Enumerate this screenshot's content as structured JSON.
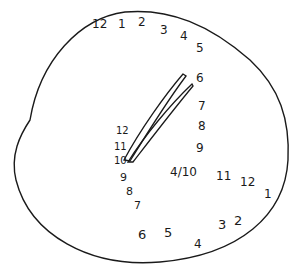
{
  "figure": {
    "type": "hand-drawn clock sketch",
    "stroke_color": "#1a1a1a",
    "background": "#ffffff",
    "numbers": [
      {
        "id": "n-top-12",
        "text": "12",
        "x": 92,
        "y": 18
      },
      {
        "id": "n-top-1",
        "text": "1",
        "x": 118,
        "y": 18
      },
      {
        "id": "n-top-2",
        "text": "2",
        "x": 138,
        "y": 16
      },
      {
        "id": "n-top-3",
        "text": "3",
        "x": 160,
        "y": 24
      },
      {
        "id": "n-top-4",
        "text": "4",
        "x": 180,
        "y": 30
      },
      {
        "id": "n-top-5",
        "text": "5",
        "x": 196,
        "y": 42
      },
      {
        "id": "n-right-6",
        "text": "6",
        "x": 196,
        "y": 72
      },
      {
        "id": "n-right-7",
        "text": "7",
        "x": 198,
        "y": 100
      },
      {
        "id": "n-right-8",
        "text": "8",
        "x": 198,
        "y": 120
      },
      {
        "id": "n-right-9",
        "text": "9",
        "x": 196,
        "y": 142
      },
      {
        "id": "n-mid-10",
        "text": "4/10",
        "x": 170,
        "y": 166
      },
      {
        "id": "n-mid-11",
        "text": "11",
        "x": 216,
        "y": 170
      },
      {
        "id": "n-mid-12",
        "text": "12",
        "x": 240,
        "y": 176
      },
      {
        "id": "n-mid-1",
        "text": "1",
        "x": 264,
        "y": 188
      },
      {
        "id": "n-left-12",
        "text": "12",
        "x": 116,
        "y": 126
      },
      {
        "id": "n-left-11",
        "text": "11",
        "x": 114,
        "y": 142
      },
      {
        "id": "n-left-10",
        "text": "10",
        "x": 114,
        "y": 156
      },
      {
        "id": "n-left-9",
        "text": "9",
        "x": 120,
        "y": 172
      },
      {
        "id": "n-left-8",
        "text": "8",
        "x": 126,
        "y": 186
      },
      {
        "id": "n-left-7",
        "text": "7",
        "x": 134,
        "y": 200
      },
      {
        "id": "n-bot-6",
        "text": "6",
        "x": 138,
        "y": 228
      },
      {
        "id": "n-bot-5",
        "text": "5",
        "x": 164,
        "y": 226
      },
      {
        "id": "n-bot-4",
        "text": "4",
        "x": 194,
        "y": 238
      },
      {
        "id": "n-bot-3",
        "text": "3",
        "x": 218,
        "y": 218
      },
      {
        "id": "n-bot-2",
        "text": "2",
        "x": 234,
        "y": 214
      }
    ]
  }
}
